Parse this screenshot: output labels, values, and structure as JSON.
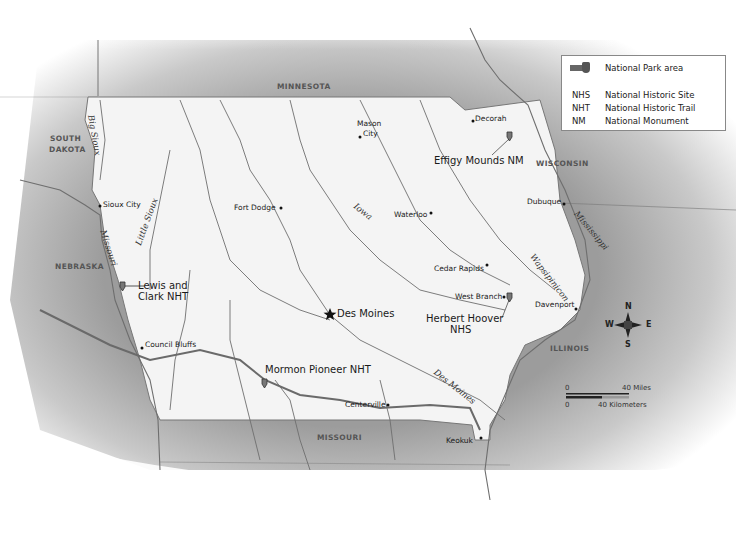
{
  "legend": {
    "park_symbol_label": "National Park area",
    "entries": [
      {
        "abbr": "NHS",
        "meaning": "National Historic Site"
      },
      {
        "abbr": "NHT",
        "meaning": "National Historic Trail"
      },
      {
        "abbr": "NM",
        "meaning": "National Monument"
      }
    ]
  },
  "states": {
    "minnesota": "MINNESOTA",
    "south_dakota_1": "SOUTH",
    "south_dakota_2": "DAKOTA",
    "nebraska": "NEBRASKA",
    "wisconsin": "WISCONSIN",
    "illinois": "ILLINOIS",
    "missouri": "MISSOURI"
  },
  "cities": {
    "capital": "Des Moines",
    "list": [
      "Sioux City",
      "Council Bluffs",
      "Fort Dodge",
      "Mason",
      "City",
      "Decorah",
      "Waterloo",
      "Dubuque",
      "Cedar Rapids",
      "West Branch",
      "Davenport",
      "Centerville",
      "Keokuk"
    ]
  },
  "parks": {
    "effigy": "Effigy Mounds NM",
    "lewis_1": "Lewis and",
    "lewis_2": "Clark NHT",
    "hoover_1": "Herbert Hoover",
    "hoover_2": "NHS",
    "mormon": "Mormon Pioneer NHT"
  },
  "rivers": {
    "big_sioux": "Big Sioux",
    "missouri": "Missouri",
    "little_sioux": "Little Sioux",
    "iowa": "Iowa",
    "mississippi": "Mississippi",
    "wapsipinicon": "Wapsipinicon",
    "des_moines": "Des Moines"
  },
  "compass": {
    "n": "N",
    "s": "S",
    "e": "E",
    "w": "W"
  },
  "scale": {
    "zero_top": "0",
    "miles": "40 Miles",
    "zero_bottom": "0",
    "km": "40 Kilometers"
  },
  "colors": {
    "iowa_fill": "#f4f4f4",
    "neighbor_fill": "#a9a9a9",
    "river": "#6e6e6e",
    "trail": "#6a6a6a"
  }
}
